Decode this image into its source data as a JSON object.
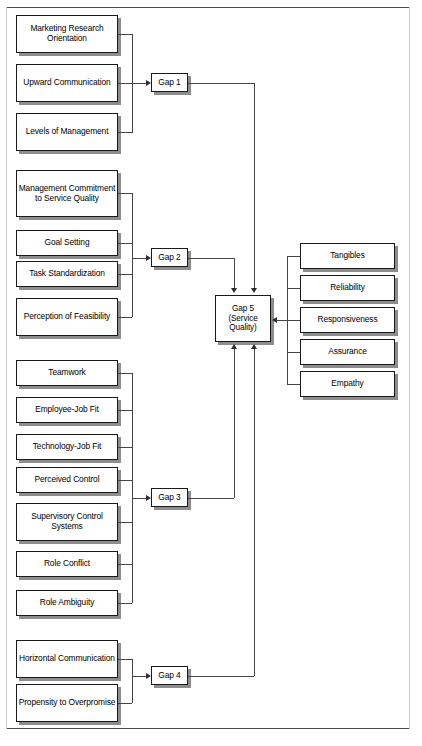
{
  "diagram": {
    "gap1": {
      "label": "Gap 1",
      "antecedents": [
        {
          "label": "Marketing Research Orientation",
          "x": 16,
          "y": 15,
          "w": 102,
          "h": 38
        },
        {
          "label": "Upward Communication",
          "x": 16,
          "y": 64,
          "w": 102,
          "h": 38
        },
        {
          "label": "Levels of Management",
          "x": 16,
          "y": 113,
          "w": 102,
          "h": 38
        }
      ]
    },
    "gap2": {
      "label": "Gap 2",
      "antecedents": [
        {
          "label": "Management Commitment to Service Quality",
          "x": 16,
          "y": 170,
          "w": 102,
          "h": 47
        },
        {
          "label": "Goal Setting",
          "x": 16,
          "y": 230,
          "w": 102,
          "h": 26
        },
        {
          "label": "Task Standardization",
          "x": 16,
          "y": 261,
          "w": 102,
          "h": 26
        },
        {
          "label": "Perception of Feasibility",
          "x": 16,
          "y": 298,
          "w": 102,
          "h": 38
        }
      ]
    },
    "gap3": {
      "label": "Gap 3",
      "antecedents": [
        {
          "label": "Teamwork",
          "x": 16,
          "y": 360,
          "w": 102,
          "h": 26
        },
        {
          "label": "Employee-Job Fit",
          "x": 16,
          "y": 397,
          "w": 102,
          "h": 26
        },
        {
          "label": "Technology-Job Fit",
          "x": 16,
          "y": 434,
          "w": 102,
          "h": 26
        },
        {
          "label": "Perceived Control",
          "x": 16,
          "y": 467,
          "w": 102,
          "h": 26
        },
        {
          "label": "Supervisory Control Systems",
          "x": 16,
          "y": 503,
          "w": 102,
          "h": 38
        },
        {
          "label": "Role Conflict",
          "x": 16,
          "y": 551,
          "w": 102,
          "h": 26
        },
        {
          "label": "Role Ambiguity",
          "x": 16,
          "y": 590,
          "w": 102,
          "h": 26
        }
      ]
    },
    "gap4": {
      "label": "Gap 4",
      "antecedents": [
        {
          "label": "Horizontal Communication",
          "x": 16,
          "y": 640,
          "w": 102,
          "h": 38
        },
        {
          "label": "Propensity to Overpromise",
          "x": 16,
          "y": 684,
          "w": 102,
          "h": 38
        }
      ]
    },
    "gap5": {
      "label": "Gap 5 (Service Quality)",
      "line1": "Gap 5",
      "line2": "(Service",
      "line3": "Quality)"
    },
    "dimensions": [
      {
        "label": "Tangibles",
        "x": 300,
        "y": 243,
        "w": 95,
        "h": 26
      },
      {
        "label": "Reliability",
        "x": 300,
        "y": 275,
        "w": 95,
        "h": 26
      },
      {
        "label": "Responsiveness",
        "x": 300,
        "y": 307,
        "w": 95,
        "h": 26
      },
      {
        "label": "Assurance",
        "x": 300,
        "y": 339,
        "w": 95,
        "h": 26
      },
      {
        "label": "Empathy",
        "x": 300,
        "y": 371,
        "w": 95,
        "h": 26
      }
    ]
  }
}
